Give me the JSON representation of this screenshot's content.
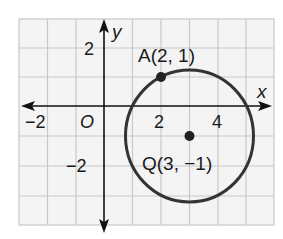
{
  "diagram": {
    "type": "coordinate-plane",
    "grid": {
      "x_min": -3,
      "x_max": 6,
      "y_min": -4,
      "y_max": 3,
      "color": "#c8c8c8",
      "background": "#f4f4f4"
    },
    "axes": {
      "x_label": "x",
      "y_label": "y",
      "origin_label": "O",
      "color": "#111111"
    },
    "tick_labels": {
      "x_neg2": "−2",
      "x_2": "2",
      "x_4": "4",
      "y_2": "2",
      "y_neg2": "−2"
    },
    "points": [
      {
        "name": "A",
        "x": 2,
        "y": 1,
        "label": "A(2, 1)"
      },
      {
        "name": "Q",
        "x": 3,
        "y": -1,
        "label": "Q(3, −1)"
      }
    ],
    "circle": {
      "center": "Q",
      "through": "A",
      "stroke": "#333333"
    }
  }
}
